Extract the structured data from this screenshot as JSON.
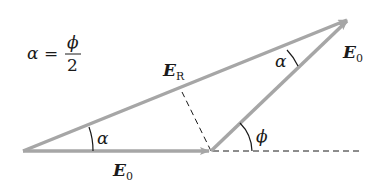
{
  "diagram": {
    "type": "phasor-addition",
    "formula": {
      "lhs": "α",
      "eq": "=",
      "numerator": "ϕ",
      "denominator": "2"
    },
    "vectors": [
      {
        "name": "E0-horizontal",
        "label_main": "E",
        "label_sub": "0",
        "from": [
          23,
          151
        ],
        "to": [
          211,
          151
        ]
      },
      {
        "name": "E0-rotated",
        "label_main": "E",
        "label_sub": "0",
        "from": [
          211,
          151
        ],
        "to": [
          349,
          19
        ]
      },
      {
        "name": "ER-resultant",
        "label_main": "E",
        "label_sub": "R",
        "from": [
          23,
          151
        ],
        "to": [
          349,
          19
        ]
      }
    ],
    "angles": {
      "alpha_bottom": "α",
      "alpha_top": "α",
      "phi": "ϕ"
    },
    "colors": {
      "arrow": "#a6a6a6",
      "dash": "#1a1a1a",
      "text": "#1a1a1a"
    }
  }
}
